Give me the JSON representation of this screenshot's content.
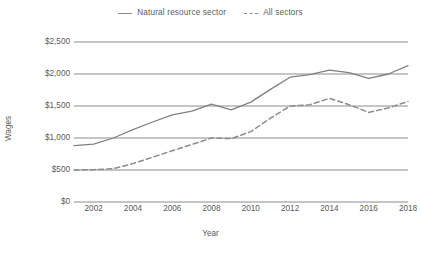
{
  "chart_data": {
    "type": "line",
    "title": "",
    "xlabel": "Year",
    "ylabel": "Wages",
    "xlim": [
      2001,
      2018
    ],
    "ylim": [
      0,
      2500
    ],
    "grid": true,
    "legend_position": "top-center",
    "y_ticks": [
      "$0",
      "$500",
      "$1,000",
      "$1,500",
      "$2,000",
      "$2,500"
    ],
    "y_tick_values": [
      0,
      500,
      1000,
      1500,
      2000,
      2500
    ],
    "x_ticks": [
      "2002",
      "2004",
      "2006",
      "2008",
      "2010",
      "2012",
      "2014",
      "2016",
      "2018"
    ],
    "x_tick_values": [
      2002,
      2004,
      2006,
      2008,
      2010,
      2012,
      2014,
      2016,
      2018
    ],
    "x": [
      2001,
      2002,
      2003,
      2004,
      2005,
      2006,
      2007,
      2008,
      2009,
      2010,
      2011,
      2012,
      2013,
      2014,
      2015,
      2016,
      2017,
      2018
    ],
    "series": [
      {
        "name": "Natural resource sector",
        "style": "solid",
        "color": "#808080",
        "values": [
          880,
          905,
          1000,
          1130,
          1250,
          1360,
          1420,
          1530,
          1440,
          1560,
          1760,
          1950,
          1990,
          2060,
          2020,
          1930,
          2000,
          2130
        ]
      },
      {
        "name": "All sectors",
        "style": "dashed",
        "color": "#8c8c8c",
        "values": [
          500,
          505,
          520,
          600,
          700,
          800,
          900,
          1000,
          990,
          1100,
          1310,
          1500,
          1520,
          1620,
          1520,
          1400,
          1470,
          1570
        ]
      }
    ]
  },
  "legend": {
    "items": [
      {
        "label": "Natural resource sector",
        "style": "solid"
      },
      {
        "label": "All sectors",
        "style": "dashed"
      }
    ]
  },
  "axes": {
    "x_title": "Year",
    "y_title": "Wages"
  },
  "colors": {
    "line_solid": "#808080",
    "line_dashed": "#8c8c8c",
    "gridline": "#808080",
    "text": "#5a5a5a"
  }
}
